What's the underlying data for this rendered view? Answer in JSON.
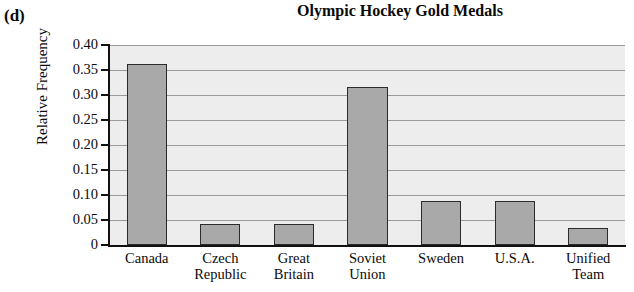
{
  "panel": {
    "label": "(d)"
  },
  "chart_data": {
    "type": "bar",
    "title": "Olympic Hockey Gold Medals",
    "xlabel": "",
    "ylabel": "Relative Frequency",
    "categories": [
      "Canada",
      "Czech Republic",
      "Great Britain",
      "Soviet Union",
      "Sweden",
      "U.S.A.",
      "Unified Team"
    ],
    "category_lines": [
      [
        "Canada"
      ],
      [
        "Czech",
        "Republic"
      ],
      [
        "Great",
        "Britain"
      ],
      [
        "Soviet",
        "Union"
      ],
      [
        "Sweden"
      ],
      [
        "U.S.A."
      ],
      [
        "Unified",
        "Team"
      ]
    ],
    "values": [
      0.362,
      0.043,
      0.043,
      0.316,
      0.088,
      0.088,
      0.034
    ],
    "ylim": [
      0,
      0.4
    ],
    "yticks": [
      0,
      0.05,
      0.1,
      0.15,
      0.2,
      0.25,
      0.3,
      0.35,
      0.4
    ],
    "ytick_labels": [
      "0",
      "0.05",
      "0.10",
      "0.15",
      "0.20",
      "0.25",
      "0.30",
      "0.35",
      "0.40"
    ],
    "grid": true,
    "legend": "none",
    "bar_fill_color": "#a9a9a9",
    "bar_edge_color": "#2b2b2b",
    "plot_background_color": "#ededed",
    "gridline_color": "#9a9a9a",
    "axis_color": "#111111"
  }
}
